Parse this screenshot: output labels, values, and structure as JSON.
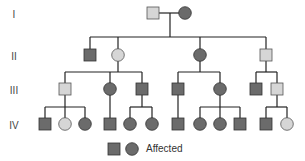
{
  "colors": {
    "affected": "#6b6b6b",
    "unaffected": "#d6d6d6",
    "line": "#222222"
  },
  "generations": [
    {
      "label": "I",
      "y": 14
    },
    {
      "label": "II",
      "y": 56
    },
    {
      "label": "III",
      "y": 90
    },
    {
      "label": "IV",
      "y": 125
    }
  ],
  "individuals": [
    {
      "id": "I-1",
      "gen": "I",
      "sex": "male",
      "status": "unaffected",
      "x": 153,
      "y": 13
    },
    {
      "id": "I-2",
      "gen": "I",
      "sex": "female",
      "status": "affected",
      "x": 185,
      "y": 13
    },
    {
      "id": "II-1",
      "gen": "II",
      "sex": "male",
      "status": "affected",
      "x": 90,
      "y": 55
    },
    {
      "id": "II-2",
      "gen": "II",
      "sex": "female",
      "status": "unaffected",
      "x": 118,
      "y": 55
    },
    {
      "id": "II-3",
      "gen": "II",
      "sex": "female",
      "status": "affected",
      "x": 200,
      "y": 55
    },
    {
      "id": "II-4",
      "gen": "II",
      "sex": "male",
      "status": "unaffected",
      "x": 266,
      "y": 55
    },
    {
      "id": "III-1",
      "gen": "III",
      "sex": "male",
      "status": "unaffected",
      "x": 65,
      "y": 89
    },
    {
      "id": "III-2",
      "gen": "III",
      "sex": "female",
      "status": "affected",
      "x": 110,
      "y": 89
    },
    {
      "id": "III-3",
      "gen": "III",
      "sex": "male",
      "status": "affected",
      "x": 142,
      "y": 89
    },
    {
      "id": "III-4",
      "gen": "III",
      "sex": "male",
      "status": "affected",
      "x": 178,
      "y": 89
    },
    {
      "id": "III-5",
      "gen": "III",
      "sex": "female",
      "status": "affected",
      "x": 220,
      "y": 89
    },
    {
      "id": "III-6",
      "gen": "III",
      "sex": "male",
      "status": "affected",
      "x": 256,
      "y": 89
    },
    {
      "id": "III-7",
      "gen": "III",
      "sex": "male",
      "status": "unaffected",
      "x": 277,
      "y": 89
    },
    {
      "id": "IV-1",
      "gen": "IV",
      "sex": "male",
      "status": "affected",
      "x": 45,
      "y": 124
    },
    {
      "id": "IV-2",
      "gen": "IV",
      "sex": "female",
      "status": "unaffected",
      "x": 65,
      "y": 124
    },
    {
      "id": "IV-3",
      "gen": "IV",
      "sex": "female",
      "status": "affected",
      "x": 85,
      "y": 124
    },
    {
      "id": "IV-4",
      "gen": "IV",
      "sex": "male",
      "status": "affected",
      "x": 110,
      "y": 124
    },
    {
      "id": "IV-5",
      "gen": "IV",
      "sex": "female",
      "status": "affected",
      "x": 130,
      "y": 124
    },
    {
      "id": "IV-6",
      "gen": "IV",
      "sex": "female",
      "status": "affected",
      "x": 152,
      "y": 124
    },
    {
      "id": "IV-7",
      "gen": "IV",
      "sex": "male",
      "status": "affected",
      "x": 178,
      "y": 124
    },
    {
      "id": "IV-8",
      "gen": "IV",
      "sex": "female",
      "status": "affected",
      "x": 200,
      "y": 124
    },
    {
      "id": "IV-9",
      "gen": "IV",
      "sex": "female",
      "status": "affected",
      "x": 220,
      "y": 124
    },
    {
      "id": "IV-10",
      "gen": "IV",
      "sex": "male",
      "status": "affected",
      "x": 240,
      "y": 124
    },
    {
      "id": "IV-11",
      "gen": "IV",
      "sex": "male",
      "status": "affected",
      "x": 266,
      "y": 124
    },
    {
      "id": "IV-12",
      "gen": "IV",
      "sex": "female",
      "status": "unaffected",
      "x": 287,
      "y": 124
    }
  ],
  "lines": [
    [
      159,
      13,
      179,
      13
    ],
    [
      170,
      13,
      170,
      37
    ],
    [
      90,
      37,
      266,
      37
    ],
    [
      90,
      37,
      90,
      49
    ],
    [
      118,
      37,
      118,
      49
    ],
    [
      200,
      37,
      200,
      49
    ],
    [
      266,
      37,
      266,
      49
    ],
    [
      118,
      61,
      118,
      72
    ],
    [
      65,
      72,
      142,
      72
    ],
    [
      65,
      72,
      65,
      83
    ],
    [
      110,
      72,
      110,
      83
    ],
    [
      142,
      72,
      142,
      83
    ],
    [
      200,
      61,
      200,
      72
    ],
    [
      178,
      72,
      220,
      72
    ],
    [
      178,
      72,
      178,
      83
    ],
    [
      220,
      72,
      220,
      83
    ],
    [
      266,
      61,
      266,
      72
    ],
    [
      256,
      72,
      277,
      72
    ],
    [
      256,
      72,
      256,
      83
    ],
    [
      277,
      72,
      277,
      83
    ],
    [
      65,
      95,
      65,
      107
    ],
    [
      45,
      107,
      85,
      107
    ],
    [
      45,
      107,
      45,
      118
    ],
    [
      65,
      107,
      65,
      118
    ],
    [
      85,
      107,
      85,
      118
    ],
    [
      110,
      95,
      110,
      118
    ],
    [
      142,
      95,
      142,
      107
    ],
    [
      130,
      107,
      152,
      107
    ],
    [
      130,
      107,
      130,
      118
    ],
    [
      152,
      107,
      152,
      118
    ],
    [
      178,
      95,
      178,
      118
    ],
    [
      220,
      95,
      220,
      107
    ],
    [
      200,
      107,
      240,
      107
    ],
    [
      200,
      107,
      200,
      118
    ],
    [
      220,
      107,
      220,
      118
    ],
    [
      240,
      107,
      240,
      118
    ],
    [
      277,
      95,
      277,
      107
    ],
    [
      266,
      107,
      287,
      107
    ],
    [
      266,
      107,
      266,
      118
    ],
    [
      287,
      107,
      287,
      118
    ]
  ],
  "legend": {
    "label": "Affected",
    "square_x": 114,
    "circle_x": 132,
    "y": 149
  }
}
